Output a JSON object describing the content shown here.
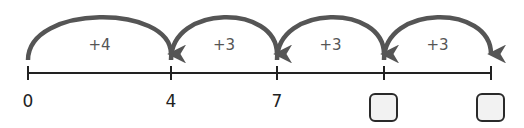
{
  "diagram": {
    "type": "number-line-jumps",
    "ticks": [
      {
        "value": "0",
        "known": true
      },
      {
        "value": "4",
        "known": true
      },
      {
        "value": "7",
        "known": true
      },
      {
        "value": "",
        "known": false
      },
      {
        "value": "",
        "known": false
      }
    ],
    "jumps": [
      {
        "label": "+4"
      },
      {
        "label": "+3"
      },
      {
        "label": "+3"
      },
      {
        "label": "+3"
      }
    ],
    "colors": {
      "arc": "#555555",
      "axis": "#222222",
      "box_fill": "#f2f2f2",
      "box_border": "#2a2a2a"
    }
  }
}
